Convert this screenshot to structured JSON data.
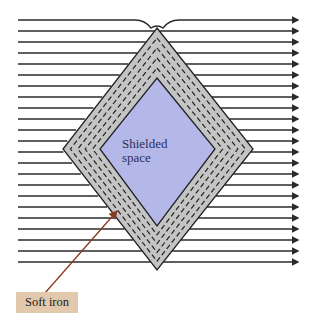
{
  "figure": {
    "labels": {
      "shielded_space": "Shielded\nspace",
      "material": "Soft iron"
    },
    "colors": {
      "field_line": "#2a2a2a",
      "iron_fill": "#c4c4c4",
      "shielded_fill": "#b3b8e8",
      "label_box": "#e2c9ad",
      "pointer_arrow": "#8b3a22"
    },
    "field_lines": {
      "count": 23,
      "direction": "left-to-right",
      "x_start": 18,
      "x_end": 298,
      "y_first": 20,
      "spacing": 11
    },
    "shield": {
      "shape": "diamond",
      "outer": {
        "top": [
          157,
          28
        ],
        "right": [
          253,
          149
        ],
        "bottom": [
          157,
          270
        ],
        "left": [
          63,
          149
        ]
      },
      "inner": {
        "top": [
          157,
          78
        ],
        "right": [
          215,
          149
        ],
        "bottom": [
          157,
          226
        ],
        "left": [
          100,
          149
        ]
      }
    }
  }
}
